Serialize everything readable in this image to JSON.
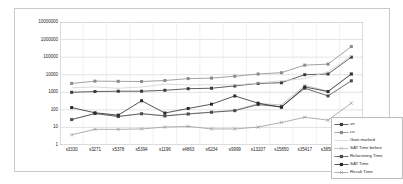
{
  "chart_data": {
    "type": "line",
    "title": "",
    "subtitle": "",
    "xlabel": "",
    "ylabel": "",
    "yscale": "log",
    "ylim": [
      1,
      10000000
    ],
    "yticks": [
      "1",
      "10",
      "100",
      "1000",
      "10000",
      "100000",
      "1000000",
      "10000000"
    ],
    "grid": true,
    "legend_position": "bottom-right",
    "categories": [
      "s3330",
      "s3271",
      "s5378",
      "s5394",
      "s1196",
      "s4863",
      "s6234",
      "s9999",
      "s13207",
      "s15850",
      "s35417",
      "s38584",
      "s2"
    ],
    "series": [
      {
        "name": "vn",
        "marker": "square",
        "color": "#3a3a3a",
        "values": [
          1000,
          1100,
          1150,
          1150,
          1300,
          1600,
          1700,
          2300,
          3200,
          3500,
          10000,
          11000,
          100000
        ]
      },
      {
        "name": "cn",
        "marker": "square",
        "color": "#8a8a8a",
        "values": [
          3200,
          4300,
          4200,
          4100,
          4700,
          6000,
          6400,
          8200,
          11000,
          13000,
          35000,
          40000,
          400000
        ]
      },
      {
        "name": "Gate marked",
        "marker": "none",
        "color": "#d6d6d6",
        "values": [
          1800,
          2000,
          1700,
          2000,
          2900,
          2600,
          2700,
          2600,
          3400,
          4500,
          6000,
          15000,
          120000
        ]
      },
      {
        "name": "SAT Time before",
        "marker": "cross",
        "color": "#b5b5b5",
        "values": [
          28,
          62,
          42,
          62,
          47,
          60,
          75,
          95,
          230,
          190,
          2500,
          1150,
          11000
        ]
      },
      {
        "name": "Refactoring Time",
        "marker": "square",
        "color": "#4a4a4a",
        "values": [
          28,
          62,
          42,
          60,
          45,
          58,
          73,
          90,
          200,
          150,
          1700,
          620,
          4500
        ]
      },
      {
        "name": "SAT Time",
        "marker": "square",
        "color": "#2b2b2b",
        "values": [
          135,
          68,
          50,
          330,
          66,
          120,
          210,
          620,
          240,
          140,
          2000,
          1100,
          11000
        ]
      },
      {
        "name": "Result Time",
        "marker": "cross",
        "color": "#9a9a9a",
        "values": [
          3.8,
          7.8,
          7.8,
          8.2,
          10.5,
          11.5,
          8.2,
          8.2,
          10.5,
          19,
          38,
          26,
          240
        ]
      }
    ]
  },
  "legend": {
    "items": [
      {
        "label": "vn"
      },
      {
        "label": "cn"
      },
      {
        "label": "Gate marked"
      },
      {
        "label": "SAT Time before"
      },
      {
        "label": "Refactoring Time"
      },
      {
        "label": "SAT Time"
      },
      {
        "label": "Result Time"
      }
    ]
  }
}
